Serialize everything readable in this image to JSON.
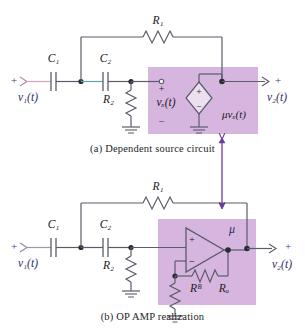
{
  "figure": {
    "title_a": "(a)  Dependent source circuit",
    "title_b": "(b)  OP AMP realization",
    "colors": {
      "block_fill": "#d6b6de",
      "block_stroke": "#b49bc4",
      "wire": "#5b5b6b",
      "wire_pink": "#d9a6b8",
      "wire_teal": "#5fa8a0",
      "arrow_purple": "#6a3d9a",
      "text": "#1a1a1a"
    }
  },
  "panel_a": {
    "name": "dependent-source-circuit",
    "input_polarity": "+",
    "input_label": "v₁(t)",
    "output_polarity": "+",
    "output_label": "v₂(t)",
    "components": [
      {
        "id": "R1",
        "label": "R₁",
        "type": "resistor",
        "orientation": "horizontal",
        "position": "feedback-top"
      },
      {
        "id": "C1",
        "label": "C₁",
        "type": "capacitor",
        "orientation": "vertical-plates",
        "position": "input-series"
      },
      {
        "id": "C2",
        "label": "C₂",
        "type": "capacitor",
        "orientation": "vertical-plates",
        "position": "second-series"
      },
      {
        "id": "R2",
        "label": "R₂",
        "type": "resistor",
        "orientation": "vertical",
        "position": "shunt-to-ground"
      },
      {
        "id": "VX",
        "label": "vₓ(t)",
        "type": "node-voltage",
        "plus": "+",
        "minus": "−"
      },
      {
        "id": "SRC",
        "label": "μvₓ(t)",
        "type": "dependent-voltage-source",
        "shape": "diamond",
        "plus": "+",
        "minus": "−"
      }
    ]
  },
  "panel_b": {
    "name": "op-amp-realization",
    "input_polarity": "+",
    "input_label": "v₁(t)",
    "output_polarity": "+",
    "output_label": "v₂(t)",
    "gain_label": "μ",
    "components": [
      {
        "id": "R1",
        "label": "R₁",
        "type": "resistor",
        "orientation": "horizontal",
        "position": "feedback-top"
      },
      {
        "id": "C1",
        "label": "C₁",
        "type": "capacitor",
        "orientation": "vertical-plates",
        "position": "input-series"
      },
      {
        "id": "C2",
        "label": "C₂",
        "type": "capacitor",
        "orientation": "vertical-plates",
        "position": "second-series"
      },
      {
        "id": "R2",
        "label": "R₂",
        "type": "resistor",
        "orientation": "vertical",
        "position": "shunt-to-ground"
      },
      {
        "id": "RA",
        "label": "Rₐ",
        "type": "resistor",
        "orientation": "horizontal",
        "position": "opamp-feedback"
      },
      {
        "id": "RB",
        "label": "Rᴮ",
        "type": "resistor",
        "orientation": "vertical",
        "position": "opamp-to-ground"
      },
      {
        "id": "OPAMP",
        "label": "",
        "type": "op-amp",
        "plus_input": "+",
        "minus_input": "−"
      }
    ]
  },
  "link_arrow": {
    "name": "equivalence-arrow",
    "style": "double-headed-vertical"
  }
}
